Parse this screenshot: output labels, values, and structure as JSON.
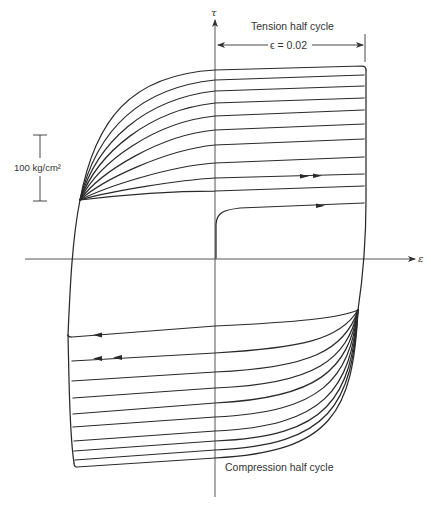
{
  "diagram": {
    "type": "stress-strain hysteresis (cyclic loading)",
    "axes": {
      "vertical_label": "τ",
      "horizontal_label": "ε"
    },
    "labels": {
      "tension": "Tension half cycle",
      "compression": "Compression half cycle",
      "strain_amplitude": "ϵ = 0.02",
      "scale_bar": "100 kg/cm²"
    },
    "tension_curves_count": 10,
    "compression_curves_count": 10,
    "arrows": {
      "first_loading": "single arrow, rightward",
      "second_loading": "double arrow, rightward",
      "first_unloading": "single arrow, leftward",
      "second_unloading": "double arrow, leftward"
    },
    "colors": {
      "line": "#2a2a2a",
      "background": "#ffffff"
    }
  }
}
